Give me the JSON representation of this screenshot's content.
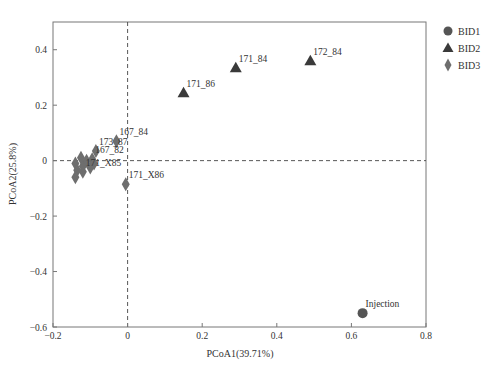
{
  "chart_data": {
    "type": "scatter",
    "title": "",
    "xlabel": "PCoA1(39.71%)",
    "ylabel": "PCoA2(25.8%)",
    "xlim": [
      -0.2,
      0.8
    ],
    "ylim": [
      -0.6,
      0.5
    ],
    "xticks": [
      -0.2,
      0,
      0.2,
      0.4,
      0.6,
      0.8
    ],
    "xtick_labels": [
      "−0.2",
      "0",
      "0.2",
      "0.4",
      "0.6",
      "0.8"
    ],
    "yticks": [
      -0.6,
      -0.4,
      -0.2,
      0,
      0.2,
      0.4
    ],
    "ytick_labels": [
      "−0.6",
      "−0.4",
      "−0.2",
      "0",
      "0.2",
      "0.4"
    ],
    "grid": false,
    "reference_lines": {
      "x": 0,
      "y": 0,
      "style": "dashed"
    },
    "legend_position": "right-top",
    "series": [
      {
        "name": "BID1",
        "marker": "circle",
        "color": "#555555",
        "points": [
          {
            "label": "Injection",
            "x": 0.63,
            "y": -0.55
          }
        ]
      },
      {
        "name": "BID2",
        "marker": "triangle",
        "color": "#3a3a3a",
        "points": [
          {
            "label": "171_86",
            "x": 0.15,
            "y": 0.245
          },
          {
            "label": "171_84",
            "x": 0.29,
            "y": 0.335
          },
          {
            "label": "172_84",
            "x": 0.49,
            "y": 0.36
          }
        ]
      },
      {
        "name": "BID3",
        "marker": "diamond",
        "color": "#6e6e6e",
        "points": [
          {
            "label": "167_84",
            "x": -0.03,
            "y": 0.07
          },
          {
            "label": "173_87",
            "x": -0.085,
            "y": 0.035
          },
          {
            "label": "167_82",
            "x": -0.095,
            "y": 0.005
          },
          {
            "label": "171_X86",
            "x": -0.005,
            "y": -0.085
          },
          {
            "label": "171_X85",
            "x": -0.12,
            "y": -0.04
          },
          {
            "label": "",
            "x": -0.14,
            "y": -0.01
          },
          {
            "label": "",
            "x": -0.135,
            "y": -0.035
          },
          {
            "label": "",
            "x": -0.14,
            "y": -0.06
          },
          {
            "label": "",
            "x": -0.12,
            "y": -0.02
          },
          {
            "label": "",
            "x": -0.11,
            "y": 0.0
          },
          {
            "label": "",
            "x": -0.1,
            "y": -0.025
          },
          {
            "label": "",
            "x": -0.125,
            "y": 0.01
          },
          {
            "label": "",
            "x": -0.09,
            "y": -0.01
          }
        ]
      }
    ]
  },
  "legend": {
    "items": [
      {
        "label": "BID1",
        "marker": "circle"
      },
      {
        "label": "BID2",
        "marker": "triangle"
      },
      {
        "label": "BID3",
        "marker": "diamond"
      }
    ]
  }
}
